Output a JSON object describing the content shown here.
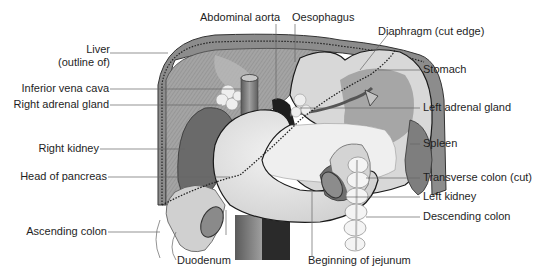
{
  "diagram": {
    "colors": {
      "background": "#ffffff",
      "text": "#1e1e1e",
      "leader_line": "#555555",
      "liver": "#9a9a9a",
      "liver_light": "#bdbdbd",
      "stomach": "#d2d2d2",
      "duodenum": "#e6e6e6",
      "kidney": "#6e6e6e",
      "spleen": "#8e8e8e",
      "vessel": "#7a7a7a",
      "outline": "#1a1a1a"
    },
    "labels": {
      "left": [
        {
          "id": "liver",
          "text": "Liver",
          "text2": "(outline of)"
        },
        {
          "id": "ivc",
          "text": "Inferior vena cava"
        },
        {
          "id": "right_adrenal",
          "text": "Right adrenal gland"
        },
        {
          "id": "right_kidney",
          "text": "Right kidney"
        },
        {
          "id": "head_pancreas",
          "text": "Head of pancreas"
        },
        {
          "id": "ascending_colon",
          "text": "Ascending colon"
        }
      ],
      "top": [
        {
          "id": "aorta",
          "text": "Abdominal aorta"
        },
        {
          "id": "oesophagus",
          "text": "Oesophagus"
        }
      ],
      "right": [
        {
          "id": "diaphragm",
          "text": "Diaphragm (cut edge)"
        },
        {
          "id": "stomach",
          "text": "Stomach"
        },
        {
          "id": "left_adrenal",
          "text": "Left adrenal gland"
        },
        {
          "id": "spleen",
          "text": "Spleen"
        },
        {
          "id": "transverse_colon",
          "text": "Transverse colon (cut)"
        },
        {
          "id": "left_kidney",
          "text": "Left kidney"
        },
        {
          "id": "descending_colon",
          "text": "Descending colon"
        }
      ],
      "bottom": [
        {
          "id": "duodenum",
          "text": "Duodenum"
        },
        {
          "id": "jejunum",
          "text": "Beginning of jejunum"
        }
      ]
    }
  }
}
